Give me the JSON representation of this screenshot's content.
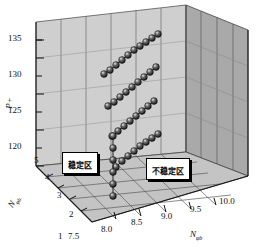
{
  "chart_data": {
    "type": "scatter",
    "title": "",
    "xlabel": "N",
    "ylabel": "P+",
    "zlabel": "N",
    "projection": "3d",
    "grid": true,
    "legend": null,
    "axes": {
      "vertical": {
        "label": "P+",
        "label_sub": "",
        "ticks": [
          "120",
          "125",
          "130",
          "135"
        ],
        "range": [
          118,
          137
        ]
      },
      "depth": {
        "label": "N",
        "label_sub": "φb",
        "ticks": [
          "1",
          "2",
          "3",
          "4",
          "5"
        ],
        "range": [
          1,
          5
        ]
      },
      "horizontal": {
        "label": "N",
        "label_sub": "φb",
        "ticks": [
          "7.5",
          "8.0",
          "8.5",
          "9.0",
          "9.5",
          "10.0"
        ],
        "range": [
          7.5,
          10.0
        ]
      }
    },
    "annotations": [
      {
        "name": "stable-zone",
        "text": "稳定区"
      },
      {
        "name": "unstable-zone",
        "text": "不稳定区"
      }
    ],
    "series": [
      {
        "name": "chain-1",
        "points_px": [
          [
            104,
            74
          ],
          [
            110,
            70
          ],
          [
            116,
            65
          ],
          [
            122,
            60
          ],
          [
            128,
            55
          ],
          [
            134,
            50
          ],
          [
            140,
            46
          ],
          [
            146,
            42
          ],
          [
            152,
            38
          ],
          [
            158,
            34
          ]
        ]
      },
      {
        "name": "chain-2",
        "points_px": [
          [
            108,
            106
          ],
          [
            114,
            102
          ],
          [
            120,
            97
          ],
          [
            126,
            92
          ],
          [
            132,
            87
          ],
          [
            138,
            82
          ],
          [
            144,
            77
          ],
          [
            150,
            72
          ],
          [
            156,
            67
          ]
        ]
      },
      {
        "name": "chain-3",
        "points_px": [
          [
            112,
            136
          ],
          [
            118,
            131
          ],
          [
            124,
            126
          ],
          [
            130,
            121
          ],
          [
            136,
            116
          ],
          [
            142,
            111
          ],
          [
            148,
            106
          ],
          [
            154,
            101
          ]
        ]
      },
      {
        "name": "chain-4",
        "points_px": [
          [
            116,
            167
          ],
          [
            122,
            161
          ],
          [
            128,
            156
          ],
          [
            134,
            151
          ],
          [
            140,
            146
          ],
          [
            146,
            142
          ],
          [
            152,
            138
          ],
          [
            158,
            134
          ]
        ]
      },
      {
        "name": "vertical-chain",
        "points_px": [
          [
            113,
            196
          ],
          [
            113,
            184
          ],
          [
            113,
            172
          ],
          [
            113,
            160
          ],
          [
            113,
            148
          ],
          [
            113,
            136
          ]
        ]
      }
    ]
  },
  "colors": {
    "back_wall": "#c9c9c9",
    "right_wall": "#a8a8a8",
    "floor": "#bdbdbd",
    "grid_line": "#4a4a4a",
    "marker": "#1a1a1a",
    "marker_highlight": "#d8d8d8",
    "label_box_bg": "#ffffff",
    "label_box_border": "#000000",
    "text": "#111111"
  }
}
